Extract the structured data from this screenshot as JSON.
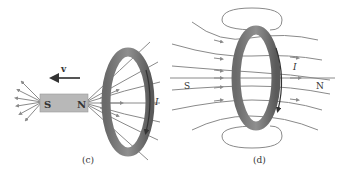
{
  "panels": [
    {
      "id": "c",
      "caption": "(c)",
      "magnet": {
        "south_label": "S",
        "north_label": "N"
      },
      "velocity_label": "v",
      "current_label": "I"
    },
    {
      "id": "d",
      "caption": "(d)",
      "south_label": "S",
      "north_label": "N",
      "current_label": "I"
    }
  ],
  "colors": {
    "field_line": "#8a8a8a",
    "magnet": "#b8b8b8",
    "ring_dark": "#5e5e5e",
    "ring_light": "#9a9a9a",
    "arrow": "#3a3a3a"
  }
}
